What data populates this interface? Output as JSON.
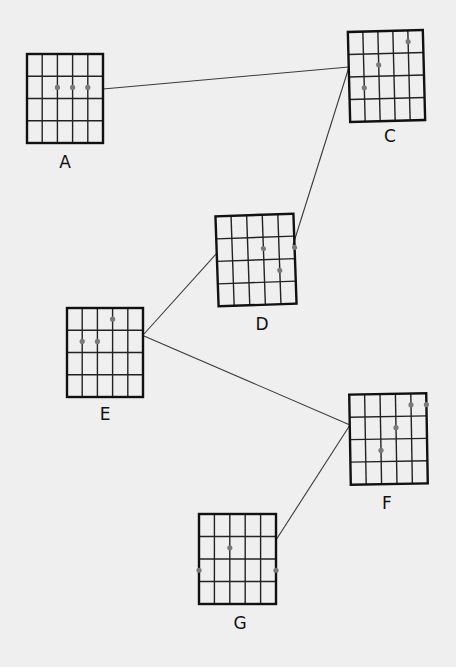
{
  "diagram": {
    "background": "#efefef",
    "grid": {
      "strings": 6,
      "frets": 4
    },
    "colors": {
      "line": "#222222",
      "frame": "#111111",
      "dot": "#7a7a7a",
      "connector": "#3a3a3a"
    },
    "chords": [
      {
        "id": "A",
        "label": "A",
        "x": 27,
        "y": 54,
        "w": 76,
        "h": 89,
        "rotate": 0,
        "label_pos": [
          65,
          168
        ],
        "dots": [
          {
            "string": 3,
            "fret": 2
          },
          {
            "string": 4,
            "fret": 2
          },
          {
            "string": 5,
            "fret": 2
          }
        ]
      },
      {
        "id": "C",
        "label": "C",
        "x": 349,
        "y": 31,
        "w": 75,
        "h": 90,
        "rotate": -1.5,
        "label_pos": [
          390,
          142
        ],
        "dots": [
          {
            "string": 2,
            "fret": 3
          },
          {
            "string": 3,
            "fret": 2
          },
          {
            "string": 5,
            "fret": 1
          }
        ]
      },
      {
        "id": "D",
        "label": "D",
        "x": 217,
        "y": 215,
        "w": 78,
        "h": 90,
        "rotate": -2,
        "label_pos": [
          262,
          330
        ],
        "dots": [
          {
            "string": 4,
            "fret": 2
          },
          {
            "string": 6,
            "fret": 2
          },
          {
            "string": 5,
            "fret": 3
          }
        ]
      },
      {
        "id": "E",
        "label": "E",
        "x": 67,
        "y": 308,
        "w": 76,
        "h": 89,
        "rotate": 0,
        "label_pos": [
          105,
          420
        ],
        "dots": [
          {
            "string": 2,
            "fret": 2
          },
          {
            "string": 3,
            "fret": 2
          },
          {
            "string": 4,
            "fret": 1
          }
        ]
      },
      {
        "id": "F",
        "label": "F",
        "x": 350,
        "y": 394,
        "w": 77,
        "h": 90,
        "rotate": -1,
        "label_pos": [
          387,
          509
        ],
        "dots": [
          {
            "string": 3,
            "fret": 3
          },
          {
            "string": 4,
            "fret": 2
          },
          {
            "string": 5,
            "fret": 1
          },
          {
            "string": 6,
            "fret": 1
          }
        ]
      },
      {
        "id": "G",
        "label": "G",
        "x": 199,
        "y": 514,
        "w": 77,
        "h": 90,
        "rotate": 0,
        "label_pos": [
          240,
          629
        ],
        "dots": [
          {
            "string": 1,
            "fret": 3
          },
          {
            "string": 3,
            "fret": 2
          },
          {
            "string": 6,
            "fret": 3
          }
        ]
      }
    ],
    "connections": [
      {
        "from": "A",
        "to": "C",
        "points": [
          103,
          89,
          349,
          67
        ]
      },
      {
        "from": "C",
        "to": "D",
        "points": [
          349,
          67,
          293,
          245
        ]
      },
      {
        "from": "E",
        "to": "D",
        "points": [
          144,
          334,
          217,
          253
        ]
      },
      {
        "from": "E",
        "to": "F",
        "points": [
          144,
          336,
          350,
          425
        ]
      },
      {
        "from": "F",
        "to": "G",
        "points": [
          350,
          425,
          276,
          540
        ]
      }
    ]
  }
}
